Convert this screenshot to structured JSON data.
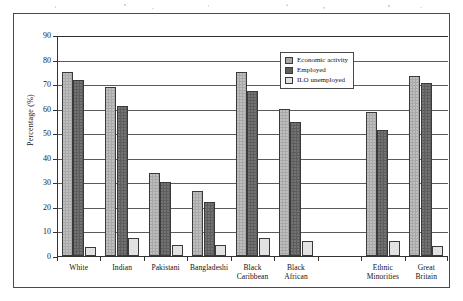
{
  "figure": {
    "background_color": "#ffffff",
    "frame_color": "#4a4a4a"
  },
  "legend": {
    "position": "top-right-inside",
    "entries": [
      {
        "label": "Economic activity",
        "color": "#a8a8a8",
        "icon": "legend-swatch-icon"
      },
      {
        "label": "Employed",
        "color": "#5d5d5d",
        "icon": "legend-swatch-icon"
      },
      {
        "label": "ILO unemployed",
        "color": "#e2e2e2",
        "icon": "legend-swatch-icon"
      }
    ]
  },
  "axes": {
    "y_title": "Percentage (%)",
    "y_ticks": [
      "0",
      "10",
      "20",
      "30",
      "40",
      "50",
      "60",
      "70",
      "80",
      "90"
    ],
    "x_title": ""
  },
  "chart_data": {
    "type": "bar",
    "title": "",
    "subtitle": "",
    "xlabel": "",
    "ylabel": "Percentage (%)",
    "ylim": [
      0,
      90
    ],
    "ytick_step": 10,
    "grid": true,
    "grid_axis": "y",
    "legend_position": "upper right",
    "categories": [
      "White",
      "Indian",
      "Pakistani",
      "Bangladeshi",
      "Black\nCaribbean",
      "Black\nAfrican",
      "Ethnic\nMinorities",
      "Great\nBritain"
    ],
    "category_labels_flat": [
      "White",
      "Indian",
      "Pakistani",
      "Bangladeshi",
      "Black Caribbean",
      "Black African",
      "Ethnic Minorities",
      "Great Britain"
    ],
    "series": [
      {
        "name": "Economic activity",
        "color": "#a8a8a8",
        "values": [
          75,
          69,
          34,
          26.5,
          75,
          60,
          58.5,
          73.5
        ]
      },
      {
        "name": "Employed",
        "color": "#5d5d5d",
        "values": [
          71.5,
          61,
          30,
          22,
          67,
          54.5,
          51.5,
          70.5
        ]
      },
      {
        "name": "ILO unemployed",
        "color": "#e2e2e2",
        "values": [
          3.5,
          7.5,
          4.5,
          4.5,
          7.5,
          6,
          6,
          4
        ]
      }
    ]
  }
}
